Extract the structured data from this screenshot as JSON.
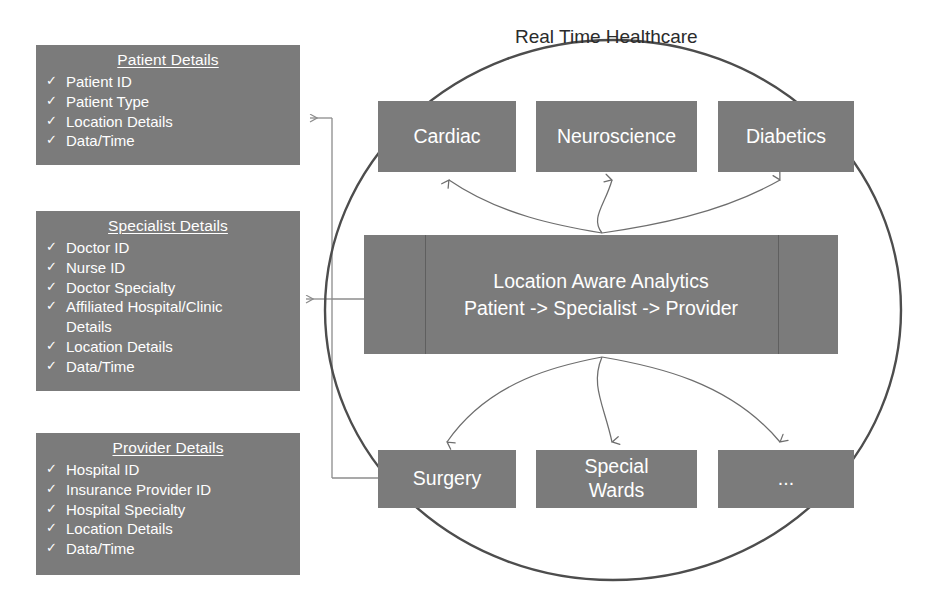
{
  "diagram": {
    "title": "Real Time Healthcare",
    "boundary_shape": "ellipse",
    "colors": {
      "box_fill": "#7b7b7b",
      "box_text": "#ffffff",
      "title_text": "#2b2b2b",
      "ellipse_stroke": "#4d4d4d",
      "arrow_stroke": "#6e6e6e",
      "connector_stroke": "#8c8c8c",
      "divider": "#5f5f5f",
      "background": "#ffffff"
    }
  },
  "detail_panels": [
    {
      "id": "patient-details",
      "title": "Patient Details",
      "items": [
        {
          "text": "Patient ID",
          "bullet": true
        },
        {
          "text": "Patient Type",
          "bullet": true
        },
        {
          "text": "Location Details",
          "bullet": true
        },
        {
          "text": "Data/Time",
          "bullet": true
        }
      ]
    },
    {
      "id": "specialist-details",
      "title": "Specialist Details",
      "items": [
        {
          "text": "Doctor ID",
          "bullet": true
        },
        {
          "text": "Nurse ID",
          "bullet": true
        },
        {
          "text": "Doctor Specialty",
          "bullet": true
        },
        {
          "text": "Affiliated Hospital/Clinic",
          "bullet": true
        },
        {
          "text": "Details",
          "bullet": false
        },
        {
          "text": "Location Details",
          "bullet": true
        },
        {
          "text": "Data/Time",
          "bullet": true
        }
      ]
    },
    {
      "id": "provider-details",
      "title": "Provider Details",
      "items": [
        {
          "text": "Hospital ID",
          "bullet": true
        },
        {
          "text": "Insurance  Provider ID",
          "bullet": true
        },
        {
          "text": "Hospital Specialty",
          "bullet": true
        },
        {
          "text": "Location Details",
          "bullet": true
        },
        {
          "text": "Data/Time",
          "bullet": true
        }
      ]
    }
  ],
  "top_nodes": [
    {
      "id": "cardiac",
      "label": "Cardiac"
    },
    {
      "id": "neuroscience",
      "label": "Neuroscience"
    },
    {
      "id": "diabetics",
      "label": "Diabetics"
    }
  ],
  "bottom_nodes": [
    {
      "id": "surgery",
      "label": "Surgery",
      "line1": "Surgery",
      "line2": ""
    },
    {
      "id": "special-wards",
      "label": "Special Wards",
      "line1": "Special",
      "line2": "Wards"
    },
    {
      "id": "ellipsis",
      "label": "...",
      "line1": "...",
      "line2": ""
    }
  ],
  "center_node": {
    "id": "location-aware-analytics",
    "line1": "Location Aware Analytics",
    "line2": "Patient -> Specialist -> Provider",
    "flow": [
      "Patient",
      "Specialist",
      "Provider"
    ]
  },
  "connections": {
    "center_to_top": [
      "cardiac",
      "neuroscience",
      "diabetics"
    ],
    "center_to_bottom": [
      "surgery",
      "special-wards",
      "ellipsis"
    ],
    "panel_links": [
      {
        "from": "patient-details",
        "direction": "left",
        "note": "arrow into Patient Details"
      },
      {
        "from": "specialist-details",
        "direction": "both",
        "note": "bidirectional with analytics box"
      },
      {
        "from": "provider-details",
        "direction": "right",
        "note": "arrow into Surgery"
      }
    ]
  }
}
